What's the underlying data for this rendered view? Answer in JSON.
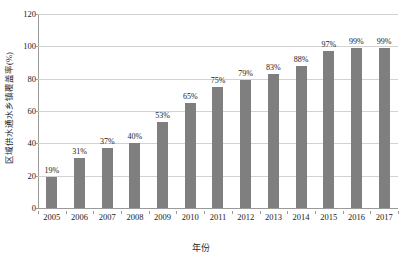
{
  "chart_data": {
    "type": "bar",
    "title": "",
    "subtitle": "",
    "xlabel": "年份",
    "ylabel": "区域供水通水乡镇覆盖率(%)",
    "categories": [
      "2005",
      "2006",
      "2007",
      "2008",
      "2009",
      "2010",
      "2011",
      "2012",
      "2013",
      "2014",
      "2015",
      "2016",
      "2017"
    ],
    "values": [
      19,
      31,
      37,
      40,
      53,
      65,
      75,
      79,
      83,
      88,
      97,
      99,
      99
    ],
    "data_labels": [
      "19%",
      "31%",
      "37%",
      "40%",
      "53%",
      "65%",
      "75%",
      "79%",
      "83%",
      "88%",
      "97%",
      "99%",
      "99%"
    ],
    "ylim": [
      0,
      120
    ],
    "ytick_values": [
      0,
      20,
      40,
      60,
      80,
      100,
      120
    ],
    "ytick_labels": [
      "0",
      "20",
      "40",
      "60",
      "80",
      "100",
      "120"
    ],
    "grid": "horizontal",
    "legend": "none",
    "series_color": "#7f7f7f",
    "gridline_color": "#d2d2d2",
    "axis_color": "#9a9a9a",
    "background_color": "#ffffff"
  }
}
